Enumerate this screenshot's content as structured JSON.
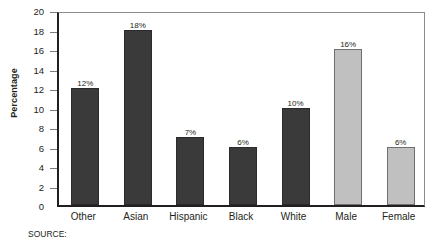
{
  "chart_data": {
    "type": "bar",
    "title": "",
    "xlabel": "",
    "ylabel": "Percentage",
    "ylim": [
      0,
      20
    ],
    "ytick_step": 2,
    "yticks": [
      0,
      2,
      4,
      6,
      8,
      10,
      12,
      14,
      16,
      18,
      20
    ],
    "grid": false,
    "legend": "none",
    "categories": [
      "Other",
      "Asian",
      "Hispanic",
      "Black",
      "White",
      "Male",
      "Female"
    ],
    "values": [
      12,
      18,
      7,
      6,
      10,
      16,
      6
    ],
    "value_labels": [
      "12%",
      "18%",
      "7%",
      "6%",
      "10%",
      "16%",
      "6%"
    ],
    "bar_colors": [
      "#3a3a3a",
      "#3a3a3a",
      "#3a3a3a",
      "#3a3a3a",
      "#3a3a3a",
      "#c0c0c0",
      "#c0c0c0"
    ],
    "bar_styles": [
      "dark",
      "dark",
      "dark",
      "dark",
      "dark",
      "light",
      "light"
    ],
    "groups": [
      {
        "name": "Race/Ethnicity",
        "categories": [
          "Other",
          "Asian",
          "Hispanic",
          "Black",
          "White"
        ],
        "color": "#3a3a3a"
      },
      {
        "name": "Gender",
        "categories": [
          "Male",
          "Female"
        ],
        "color": "#c0c0c0"
      }
    ]
  },
  "axis": {
    "y_title": "Percentage",
    "y_labels": [
      "20",
      "18",
      "16",
      "14",
      "12",
      "10",
      "8",
      "6",
      "4",
      "2",
      "0"
    ]
  },
  "caption": {
    "text": "SOURCE:",
    "note": "cut off at bottom edge"
  },
  "colors": {
    "bar_dark": "#3a3a3a",
    "bar_light": "#c0c0c0",
    "axis": "#231f20",
    "frame": "#8d8d8d",
    "background": "#ffffff"
  }
}
